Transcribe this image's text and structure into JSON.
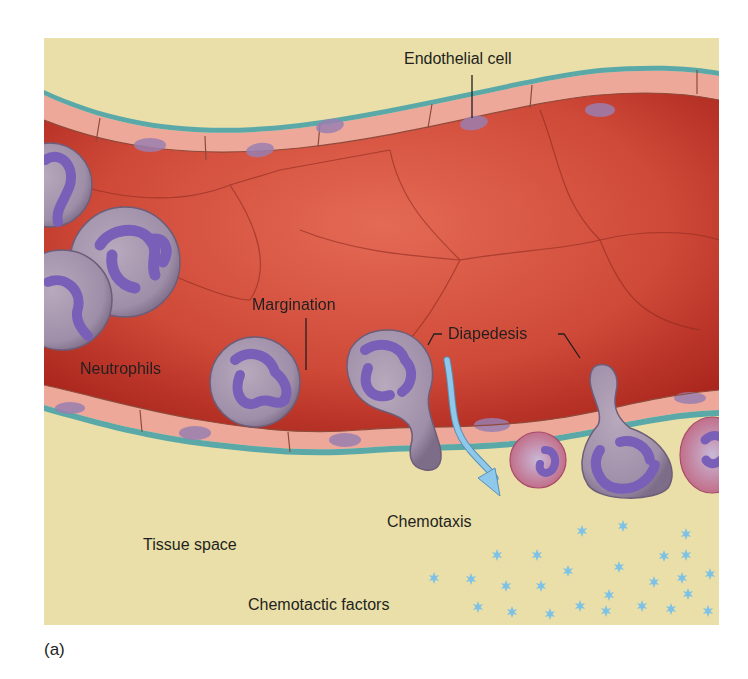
{
  "figure": {
    "panel_label": "(a)",
    "colors": {
      "tissue_background": "#eadfa8",
      "endothelium_membrane": "#5aa9a8",
      "endothelial_cell": "#eda89a",
      "endothelial_nucleus": "#9a7fb0",
      "vessel_lumen_dark": "#b8281f",
      "vessel_lumen_light": "#e0614f",
      "neutrophil_body": "#a99bb0",
      "neutrophil_nucleus": "#7a5fb8",
      "chemotactic_factor": "#7ec3e6",
      "arrow": "#8ec9ec"
    },
    "labels": {
      "endothelial_cell": "Endothelial cell",
      "margination": "Margination",
      "diapedesis": "Diapedesis",
      "neutrophils": "Neutrophils",
      "chemotaxis": "Chemotaxis",
      "tissue_space": "Tissue space",
      "chemotactic_factors": "Chemotactic factors"
    }
  }
}
